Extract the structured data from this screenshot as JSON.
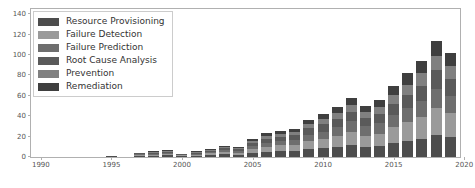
{
  "chart_data": {
    "type": "bar",
    "stacked": true,
    "title": "",
    "xlabel": "",
    "ylabel": "",
    "grid": false,
    "legend_position": "upper-left",
    "xlim": [
      1989.3,
      2019.7
    ],
    "ylim": [
      0,
      145
    ],
    "yticks": [
      0,
      20,
      40,
      60,
      80,
      100,
      120,
      140
    ],
    "xticks": [
      1990,
      1995,
      2000,
      2005,
      2010,
      2015,
      2020
    ],
    "categories": [
      1990,
      1991,
      1992,
      1993,
      1994,
      1995,
      1996,
      1997,
      1998,
      1999,
      2000,
      2001,
      2002,
      2003,
      2004,
      2005,
      2006,
      2007,
      2008,
      2009,
      2010,
      2011,
      2012,
      2013,
      2014,
      2015,
      2016,
      2017,
      2018,
      2019
    ],
    "series": [
      {
        "name": "Resource Provisioning",
        "color": "#4d4d4d",
        "values": [
          0,
          0,
          0,
          0,
          0,
          1,
          0,
          1,
          1,
          2,
          1,
          1,
          2,
          3,
          2,
          4,
          5,
          6,
          6,
          8,
          9,
          10,
          12,
          10,
          11,
          14,
          16,
          18,
          22,
          20
        ]
      },
      {
        "name": "Failure Detection",
        "color": "#9a9a9a",
        "values": [
          0,
          0,
          0,
          0,
          0,
          0,
          0,
          1,
          1,
          1,
          1,
          1,
          2,
          2,
          2,
          4,
          5,
          6,
          6,
          8,
          9,
          11,
          13,
          11,
          12,
          15,
          18,
          21,
          26,
          23
        ]
      },
      {
        "name": "Failure Prediction",
        "color": "#6e6e6e",
        "values": [
          0,
          0,
          0,
          0,
          0,
          0,
          0,
          1,
          1,
          1,
          0,
          1,
          1,
          2,
          2,
          3,
          4,
          4,
          5,
          6,
          7,
          8,
          10,
          9,
          10,
          12,
          14,
          16,
          19,
          17
        ]
      },
      {
        "name": "Root Cause Analysis",
        "color": "#5a5a5a",
        "values": [
          0,
          0,
          0,
          0,
          0,
          0,
          0,
          1,
          1,
          1,
          1,
          1,
          1,
          2,
          2,
          3,
          4,
          4,
          5,
          6,
          7,
          8,
          9,
          8,
          9,
          11,
          13,
          15,
          18,
          16
        ]
      },
      {
        "name": "Prevention",
        "color": "#808080",
        "values": [
          0,
          0,
          0,
          0,
          0,
          0,
          0,
          0,
          1,
          1,
          0,
          1,
          1,
          1,
          1,
          2,
          3,
          3,
          3,
          4,
          5,
          6,
          7,
          6,
          7,
          9,
          10,
          12,
          14,
          13
        ]
      },
      {
        "name": "Remediation",
        "color": "#3f3f3f",
        "values": [
          0,
          0,
          0,
          0,
          0,
          0,
          0,
          0,
          1,
          1,
          0,
          1,
          1,
          1,
          1,
          2,
          3,
          3,
          3,
          4,
          5,
          6,
          7,
          6,
          7,
          9,
          11,
          12,
          15,
          13
        ]
      }
    ],
    "totals": [
      0,
      0,
      0,
      0,
      0,
      1,
      0,
      4,
      6,
      7,
      3,
      6,
      8,
      11,
      10,
      18,
      24,
      26,
      28,
      36,
      42,
      49,
      58,
      50,
      56,
      70,
      82,
      94,
      114,
      102
    ]
  },
  "legend": {
    "items": [
      {
        "label": "Resource Provisioning",
        "color": "#4d4d4d"
      },
      {
        "label": "Failure Detection",
        "color": "#9a9a9a"
      },
      {
        "label": "Failure Prediction",
        "color": "#6e6e6e"
      },
      {
        "label": "Root Cause Analysis",
        "color": "#5a5a5a"
      },
      {
        "label": "Prevention",
        "color": "#808080"
      },
      {
        "label": "Remediation",
        "color": "#3f3f3f"
      }
    ]
  }
}
